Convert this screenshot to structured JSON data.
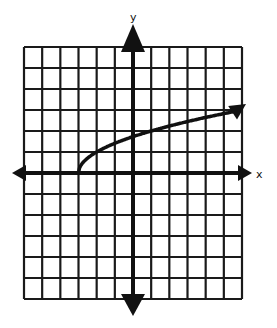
{
  "chart_data": {
    "type": "line",
    "title": "",
    "xlabel": "x",
    "ylabel": "y",
    "xlim": [
      -6,
      6
    ],
    "ylim": [
      -6,
      6
    ],
    "grid": true,
    "grid_step": 1,
    "series": [
      {
        "name": "y = sqrt(x + 3)",
        "function": "sqrt(x+3)",
        "start_point": [
          -3,
          0
        ],
        "arrow_end": true,
        "x": [
          -3,
          -2.75,
          -2,
          -1,
          0,
          1,
          2,
          3,
          4,
          5,
          6
        ],
        "y": [
          0,
          0.5,
          1,
          1.41,
          1.73,
          2,
          2.24,
          2.45,
          2.65,
          2.83,
          3
        ]
      }
    ]
  },
  "labels": {
    "x_axis": "x",
    "y_axis": "y"
  },
  "colors": {
    "line": "#111111",
    "grid": "#1a1a1a",
    "background": "#ffffff"
  }
}
